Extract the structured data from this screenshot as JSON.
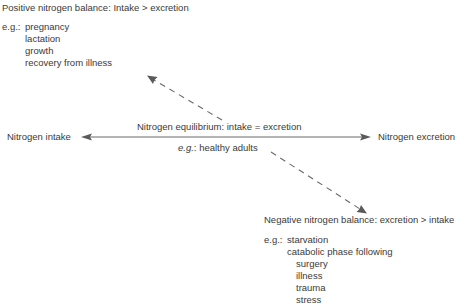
{
  "diagram": {
    "positive": {
      "title": "Positive nitrogen balance: Intake > excretion",
      "eg_prefix": "e.g.:",
      "examples": [
        "pregnancy",
        "lactation",
        "growth",
        "recovery from illness"
      ]
    },
    "equilibrium": {
      "left_label": "Nitrogen intake",
      "right_label": "Nitrogen excretion",
      "title": "Nitrogen equilibrium: intake = excretion",
      "eg_prefix": "e.g.",
      "eg_text": ": healthy adults"
    },
    "negative": {
      "title": "Negative nitrogen balance: excretion > intake",
      "eg_prefix": "e.g.:",
      "examples": [
        "starvation",
        "catabolic phase following"
      ],
      "sub_examples": [
        "surgery",
        "illness",
        "trauma",
        "stress"
      ]
    },
    "colors": {
      "text": "#3a3a3a",
      "arrow": "#666666"
    }
  }
}
